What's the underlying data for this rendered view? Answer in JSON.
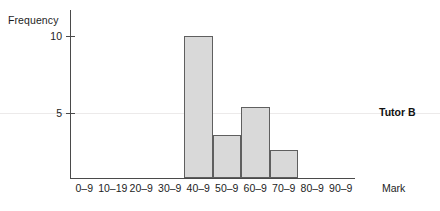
{
  "chart_data": {
    "type": "bar",
    "title": "",
    "subtitle": "",
    "xlabel": "Mark",
    "ylabel": "Frequency",
    "categories": [
      "0–9",
      "10–19",
      "20–9",
      "30–9",
      "40–9",
      "50–9",
      "60–9",
      "70–9",
      "80–9",
      "90–9"
    ],
    "values": [
      0,
      0,
      0,
      0,
      10,
      3,
      5,
      2,
      0,
      0
    ],
    "series": [
      {
        "name": "Tutor B",
        "values": [
          0,
          0,
          0,
          0,
          10,
          3,
          5,
          2,
          0,
          0
        ]
      }
    ],
    "ylim": [
      0,
      11.8
    ],
    "y_ticks": [
      5,
      10
    ],
    "y_tick_labels": [
      "5",
      "10"
    ],
    "grid": false,
    "legend": "right",
    "annotations": [
      "Tutor B"
    ],
    "bar_fill_color": "#d9d9d9",
    "bar_border_color": "#5f5f5f",
    "axis_color": "#4a4a4a"
  },
  "labels": {
    "y_axis_title": "Frequency",
    "x_axis_title": "Mark",
    "series_annotation": "Tutor B",
    "tick_10": "10",
    "tick_5": "5"
  }
}
